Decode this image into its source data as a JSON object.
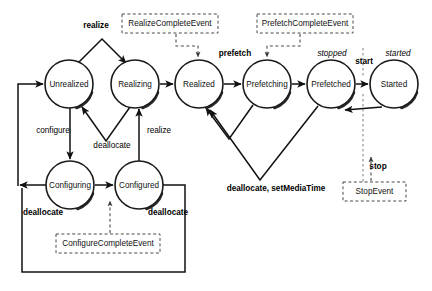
{
  "diagram": {
    "type": "state-machine",
    "canvas": {
      "width": 432,
      "height": 291
    },
    "colors": {
      "background": "#ffffff",
      "stroke": "#111111",
      "dashed_stroke": "#4a4a4a",
      "text": "#000000"
    },
    "states": [
      {
        "id": "unrealized",
        "label": "Unrealized",
        "cx": 69,
        "cy": 84,
        "r": 24
      },
      {
        "id": "realizing",
        "label": "Realizing",
        "cx": 135,
        "cy": 84,
        "r": 24
      },
      {
        "id": "realized",
        "label": "Realized",
        "cx": 199,
        "cy": 84,
        "r": 24
      },
      {
        "id": "prefetching",
        "label": "Prefetching",
        "cx": 267,
        "cy": 84,
        "r": 24
      },
      {
        "id": "prefetched",
        "label": "Prefetched",
        "cx": 331,
        "cy": 84,
        "r": 24
      },
      {
        "id": "started",
        "label": "Started",
        "cx": 394,
        "cy": 84,
        "r": 24
      },
      {
        "id": "configuring",
        "label": "Configuring",
        "cx": 70,
        "cy": 185,
        "r": 24
      },
      {
        "id": "configured",
        "label": "Configured",
        "cx": 139,
        "cy": 185,
        "r": 24
      }
    ],
    "event_boxes": [
      {
        "id": "realize-complete-event",
        "label": "RealizeCompleteEvent",
        "x": 122,
        "y": 14,
        "w": 96,
        "h": 19
      },
      {
        "id": "prefetch-complete-event",
        "label": "PrefetchCompleteEvent",
        "x": 257,
        "y": 14,
        "w": 96,
        "h": 19
      },
      {
        "id": "configure-complete-event",
        "label": "ConfigureCompleteEvent",
        "x": 56,
        "y": 234,
        "w": 104,
        "h": 19
      },
      {
        "id": "stop-event",
        "label": "StopEvent",
        "x": 343,
        "y": 182,
        "w": 63,
        "h": 19
      }
    ],
    "transition_labels": [
      {
        "id": "realize-top",
        "text": "realize",
        "x": 96,
        "y": 26,
        "style": "bold"
      },
      {
        "id": "prefetch-top",
        "text": "prefetch",
        "x": 235,
        "y": 54,
        "style": "bold"
      },
      {
        "id": "stopped",
        "text": "stopped",
        "x": 332,
        "y": 54,
        "style": "italic"
      },
      {
        "id": "start",
        "text": "start",
        "x": 364,
        "y": 62,
        "style": "bold"
      },
      {
        "id": "started-italic",
        "text": "started",
        "x": 397,
        "y": 54,
        "style": "italic"
      },
      {
        "id": "configure",
        "text": "configure",
        "x": 53,
        "y": 131,
        "style": "plain"
      },
      {
        "id": "deallocate-mid",
        "text": "deallocate",
        "x": 110,
        "y": 146,
        "style": "plain"
      },
      {
        "id": "realize-mid",
        "text": "realize",
        "x": 157,
        "y": 131,
        "style": "plain"
      },
      {
        "id": "deallocate-left",
        "text": "deallocate",
        "x": 43,
        "y": 213,
        "style": "bold"
      },
      {
        "id": "deallocate-right",
        "text": "deallocate",
        "x": 168,
        "y": 213,
        "style": "bold"
      },
      {
        "id": "deallocate-set",
        "text": "deallocate, setMediaTime",
        "x": 276,
        "y": 189,
        "style": "bold"
      },
      {
        "id": "stop",
        "text": "stop",
        "x": 376,
        "y": 167,
        "style": "bold"
      }
    ]
  }
}
